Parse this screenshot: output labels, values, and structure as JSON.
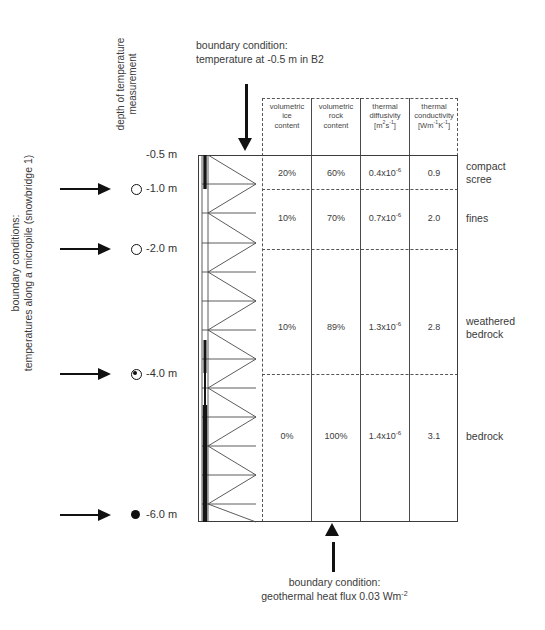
{
  "annotations": {
    "top_boundary": {
      "line1": "boundary condition:",
      "line2": "temperature at -0.5 m in B2"
    },
    "bottom_boundary": {
      "line1": "boundary condition:",
      "line2": "geothermal heat flux 0.03 Wm-2"
    },
    "left_boundary": {
      "line1": "boundary conditions:",
      "line2": "temperatures along a micropile (snowbridge 1)"
    },
    "depth_axis_label": "depth of temperature measurement"
  },
  "depth_markers": [
    {
      "label": "-0.5 m",
      "marker": "none",
      "arrow": false
    },
    {
      "label": "-1.0 m",
      "marker": "open",
      "arrow": true
    },
    {
      "label": "-2.0 m",
      "marker": "open",
      "arrow": true
    },
    {
      "label": "-4.0 m",
      "marker": "half",
      "arrow": true
    },
    {
      "label": "-6.0 m",
      "marker": "full",
      "arrow": true
    }
  ],
  "table": {
    "headers": [
      {
        "line1": "volumetric",
        "line2": "ice",
        "line3": "content",
        "units": ""
      },
      {
        "line1": "volumetric",
        "line2": "rock",
        "line3": "content",
        "units": ""
      },
      {
        "line1": "thermal",
        "line2": "diffusivity",
        "line3": "",
        "units": "[m2s-1]"
      },
      {
        "line1": "thermal",
        "line2": "conductivity",
        "line3": "",
        "units": "[Wm-1K-1]"
      }
    ],
    "rows": [
      {
        "layer": "compact scree",
        "layer_l1": "compact",
        "layer_l2": "scree",
        "ice": "20%",
        "rock": "60%",
        "diffusivity": "0.4x10-6",
        "conductivity": "0.9"
      },
      {
        "layer": "fines",
        "layer_l1": "fines",
        "layer_l2": "",
        "ice": "10%",
        "rock": "70%",
        "diffusivity": "0.7x10-6",
        "conductivity": "2.0"
      },
      {
        "layer": "weathered bedrock",
        "layer_l1": "weathered",
        "layer_l2": "bedrock",
        "ice": "10%",
        "rock": "89%",
        "diffusivity": "1.3x10-6",
        "conductivity": "2.8"
      },
      {
        "layer": "bedrock",
        "layer_l1": "bedrock",
        "layer_l2": "",
        "ice": "0%",
        "rock": "100%",
        "diffusivity": "1.4x10-6",
        "conductivity": "3.1"
      }
    ]
  },
  "colors": {
    "line": "#3c3c3c",
    "text": "#3a3a3a",
    "arrow": "#111111"
  }
}
